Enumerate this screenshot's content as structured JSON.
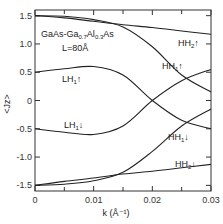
{
  "chart_data": {
    "type": "line",
    "title": "",
    "annotation": {
      "material": "GaAs-Ga0.7Al0.3As",
      "material_parts": [
        "GaAs-Ga",
        "0.7",
        "Al",
        "0.3",
        "As"
      ],
      "width": "L=80Å"
    },
    "xlabel": "k (Å⁻¹)",
    "ylabel": "<Jz>",
    "xlim": [
      0,
      0.03
    ],
    "ylim": [
      -1.6,
      1.6
    ],
    "x_ticks": [
      "0",
      "0.01",
      "0.02",
      "0.03"
    ],
    "y_ticks": [
      "1.5",
      "1.0",
      "0.5",
      "0",
      "-0.5",
      "-1.0",
      "-1.5"
    ],
    "grid": false,
    "x": [
      0,
      0.005,
      0.01,
      0.015,
      0.02,
      0.025,
      0.03
    ],
    "series": [
      {
        "name": "HH2↑",
        "label": "HH",
        "sub": "2",
        "spin": "↑",
        "values": [
          1.5,
          1.46,
          1.4,
          1.34,
          1.29,
          1.23,
          1.17
        ]
      },
      {
        "name": "HH1↑",
        "label": "HH",
        "sub": "1",
        "spin": "↑",
        "values": [
          1.5,
          1.49,
          1.43,
          1.3,
          0.95,
          0.45,
          0.15
        ]
      },
      {
        "name": "LH1↑",
        "label": "LH",
        "sub": "1",
        "spin": "↑",
        "values": [
          0.5,
          0.56,
          0.6,
          0.45,
          0.0,
          -0.35,
          -0.5
        ]
      },
      {
        "name": "LH1↓",
        "label": "LH",
        "sub": "1",
        "spin": "↓",
        "values": [
          -0.5,
          -0.56,
          -0.6,
          -0.45,
          0.0,
          0.35,
          0.55
        ]
      },
      {
        "name": "HH1↓",
        "label": "HH",
        "sub": "1",
        "spin": "↓",
        "values": [
          -1.5,
          -1.48,
          -1.42,
          -1.27,
          -0.9,
          -0.45,
          -0.15
        ]
      },
      {
        "name": "HH2↓",
        "label": "HH",
        "sub": "2",
        "spin": "↓",
        "values": [
          -1.5,
          -1.43,
          -1.37,
          -1.3,
          -1.25,
          -1.19,
          -1.13
        ]
      }
    ]
  }
}
